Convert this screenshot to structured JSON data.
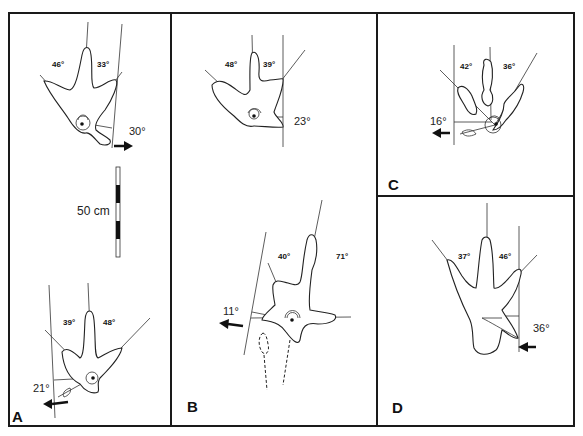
{
  "figure": {
    "panels": [
      {
        "id": "A",
        "label": "A",
        "tracks": [
          {
            "position": "upper",
            "angles": {
              "left_interdigital": "46°",
              "right_interdigital": "33°",
              "rotation": "30°"
            },
            "rotation_arrow": "right"
          },
          {
            "position": "lower",
            "angles": {
              "left_interdigital": "39°",
              "right_interdigital": "48°",
              "rotation": "21°"
            },
            "rotation_arrow": "left"
          }
        ],
        "scale_bar": {
          "label": "50 cm",
          "segments": 5
        }
      },
      {
        "id": "B",
        "label": "B",
        "tracks": [
          {
            "position": "upper",
            "angles": {
              "left_interdigital": "48°",
              "right_interdigital": "39°",
              "rotation": "23°"
            }
          },
          {
            "position": "lower",
            "angles": {
              "left_interdigital": "40°",
              "right_interdigital": "71°",
              "rotation": "11°"
            },
            "rotation_arrow": "left"
          }
        ]
      },
      {
        "id": "C",
        "label": "C",
        "tracks": [
          {
            "position": "single",
            "angles": {
              "left_interdigital": "42°",
              "right_interdigital": "36°",
              "rotation": "16°"
            },
            "rotation_arrow": "left"
          }
        ]
      },
      {
        "id": "D",
        "label": "D",
        "tracks": [
          {
            "position": "single",
            "angles": {
              "left_interdigital": "37°",
              "right_interdigital": "46°",
              "rotation": "36°"
            },
            "rotation_arrow": "left"
          }
        ]
      }
    ]
  }
}
